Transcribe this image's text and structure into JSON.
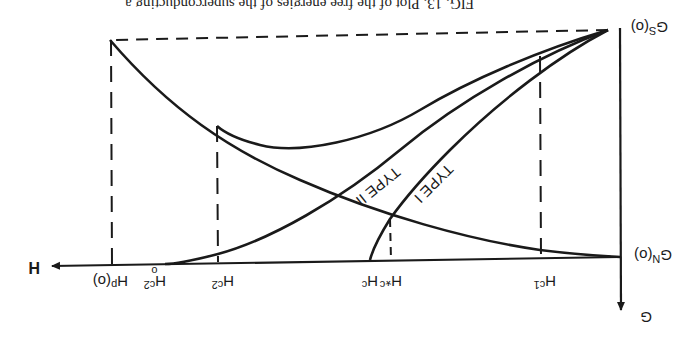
{
  "caption": {
    "text": "FIG. 13. Plot of the free energies of the superconducting a",
    "orientation": "upside-down (rotated 180°), partially cropped at top edge"
  },
  "figure": {
    "orientation": "rotated 180°",
    "colors": {
      "ink": "#1a1a1a",
      "background": "#ffffff"
    },
    "axes": {
      "x_label": "H",
      "y_label": "G"
    },
    "y_labels": {
      "gs": "G",
      "gs_sub": "S",
      "gs_suffix": "(o)",
      "gn": "G",
      "gn_sub": "N",
      "gn_suffix": "(o)"
    },
    "x_ticks": [
      {
        "id": "hc1",
        "main": "H",
        "sub": "c1",
        "sup": ""
      },
      {
        "id": "hc_star",
        "main": "H*",
        "sub": "c",
        "sup": ""
      },
      {
        "id": "hc",
        "main": "H",
        "sub": "c",
        "sup": ""
      },
      {
        "id": "hc2",
        "main": "H",
        "sub": "c2",
        "sup": ""
      },
      {
        "id": "hc2o",
        "main": "H",
        "sub": "c2",
        "sup": "o"
      },
      {
        "id": "hpo",
        "main": "H",
        "sub": "p",
        "sup": "",
        "suffix": "(o)"
      }
    ],
    "curve_labels": {
      "type1": "TYPE I",
      "type2": "TYPE II"
    }
  }
}
